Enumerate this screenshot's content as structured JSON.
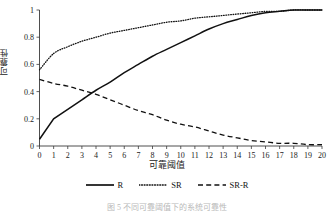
{
  "figure": {
    "caption": "图 5   不同可靠阈值下的系统可靠性"
  },
  "axes": {
    "y_title": "可靠性",
    "x_title": "可靠阈值",
    "y_ticks": [
      "0",
      "0.2",
      "0.4",
      "0.6",
      "0.8",
      "1"
    ],
    "x_ticks": [
      "0",
      "1",
      "2",
      "3",
      "4",
      "5",
      "6",
      "7",
      "8",
      "9",
      "10",
      "11",
      "12",
      "13",
      "14",
      "15",
      "16",
      "17",
      "18",
      "19",
      "20"
    ]
  },
  "legend": {
    "items": [
      {
        "label": "R",
        "style": "solid",
        "color": "#111111",
        "icon": "solid-line-icon"
      },
      {
        "label": "SR",
        "style": "dotted",
        "color": "#111111",
        "icon": "dotted-line-icon"
      },
      {
        "label": "SR-R",
        "style": "dashed",
        "color": "#111111",
        "icon": "dashed-line-icon"
      }
    ]
  },
  "chart_data": {
    "type": "line",
    "title": "",
    "subtitle": "",
    "xlabel": "可靠阈值",
    "ylabel": "可靠性",
    "xlim": [
      0,
      20
    ],
    "ylim": [
      0,
      1
    ],
    "grid": false,
    "legend_position": "bottom",
    "x": [
      0,
      1,
      2,
      3,
      4,
      5,
      6,
      7,
      8,
      9,
      10,
      11,
      12,
      13,
      14,
      15,
      16,
      17,
      18,
      19,
      20
    ],
    "series": [
      {
        "name": "R",
        "style": "solid",
        "color": "#111111",
        "values": [
          0.05,
          0.2,
          0.27,
          0.34,
          0.41,
          0.47,
          0.54,
          0.6,
          0.66,
          0.71,
          0.76,
          0.81,
          0.86,
          0.9,
          0.93,
          0.96,
          0.98,
          0.99,
          1.0,
          1.0,
          1.0
        ]
      },
      {
        "name": "SR",
        "style": "dotted",
        "color": "#111111",
        "values": [
          0.56,
          0.68,
          0.73,
          0.77,
          0.8,
          0.83,
          0.85,
          0.87,
          0.89,
          0.91,
          0.92,
          0.94,
          0.95,
          0.96,
          0.97,
          0.98,
          0.99,
          0.99,
          1.0,
          1.0,
          1.0
        ]
      },
      {
        "name": "SR-R",
        "style": "dashed",
        "color": "#111111",
        "values": [
          0.49,
          0.46,
          0.44,
          0.41,
          0.38,
          0.34,
          0.3,
          0.26,
          0.23,
          0.19,
          0.16,
          0.14,
          0.11,
          0.08,
          0.06,
          0.04,
          0.03,
          0.02,
          0.02,
          0.01,
          0.01
        ]
      }
    ],
    "annotations": [
      {
        "text": "R 与 SR-R 交点",
        "x": 3.3,
        "y": 0.37
      }
    ]
  }
}
